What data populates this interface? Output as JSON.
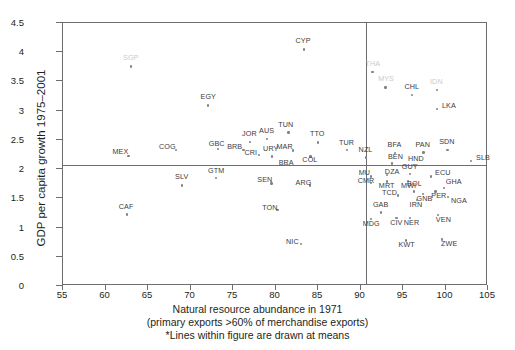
{
  "chart_data": {
    "type": "scatter",
    "title": "",
    "xlabel": "Natural resource abundance in 1971",
    "xlabel_sub": "(primary exports >60% of merchandise exports)",
    "note": "*Lines within figure are drawn at means",
    "ylabel": "GDP per capita growth 1975–2001",
    "xlim": [
      55,
      105
    ],
    "ylim": [
      0,
      4.5
    ],
    "xticks": [
      "55",
      "60",
      "65",
      "70",
      "75",
      "80",
      "85",
      "90",
      "95",
      "100",
      "105"
    ],
    "yticks": [
      "0",
      "0.5",
      "1",
      "1.5",
      "2",
      "2.5",
      "3",
      "3.5",
      "4",
      "4.5"
    ],
    "grid": false,
    "legend": "none",
    "mean_lines": {
      "x_mean": 90.6,
      "y_mean": 2.07
    },
    "point_color": "#808285",
    "line_color": "#6d6e71",
    "label_color": "#3b3b3d",
    "points": [
      {
        "label": "SGP",
        "x": 63.0,
        "y": 3.76,
        "lx": -8,
        "ly": -9,
        "faint": true
      },
      {
        "label": "CYP",
        "x": 83.3,
        "y": 4.05,
        "lx": -8,
        "ly": -9
      },
      {
        "label": "THA",
        "x": 91.4,
        "y": 3.66,
        "lx": -7,
        "ly": -9,
        "faint": true
      },
      {
        "label": "MYS",
        "x": 92.9,
        "y": 3.4,
        "lx": -7,
        "ly": -9,
        "faint": true
      },
      {
        "label": "IDN",
        "x": 99.0,
        "y": 3.36,
        "lx": -7,
        "ly": -9,
        "faint": true
      },
      {
        "label": "CHL",
        "x": 96.0,
        "y": 3.27,
        "lx": -7,
        "ly": -9
      },
      {
        "label": "EGY",
        "x": 72.0,
        "y": 3.09,
        "lx": -7,
        "ly": -9
      },
      {
        "label": "LKA",
        "x": 99.0,
        "y": 3.03,
        "lx": 5,
        "ly": -4
      },
      {
        "label": "TUN",
        "x": 81.5,
        "y": 2.63,
        "lx": -10,
        "ly": -8
      },
      {
        "label": "AUS",
        "x": 79.0,
        "y": 2.52,
        "lx": -8,
        "ly": -9
      },
      {
        "label": "JOR",
        "x": 77.0,
        "y": 2.47,
        "lx": -8,
        "ly": -9
      },
      {
        "label": "TTO",
        "x": 85.0,
        "y": 2.46,
        "lx": -8,
        "ly": -9
      },
      {
        "label": "MEX",
        "x": 62.7,
        "y": 2.23,
        "lx": -16,
        "ly": -5
      },
      {
        "label": "COG",
        "x": 68.3,
        "y": 2.33,
        "lx": -17,
        "ly": -4
      },
      {
        "label": "GBC",
        "x": 73.2,
        "y": 2.35,
        "lx": -9,
        "ly": -6
      },
      {
        "label": "BRB",
        "x": 76.2,
        "y": 2.33,
        "lx": -16,
        "ly": -4
      },
      {
        "label": "MAR",
        "x": 82.0,
        "y": 2.32,
        "lx": -16,
        "ly": -4
      },
      {
        "label": "CRI",
        "x": 78.0,
        "y": 2.25,
        "lx": -14,
        "ly": -3
      },
      {
        "label": "URY",
        "x": 79.6,
        "y": 2.22,
        "lx": -9,
        "ly": -8
      },
      {
        "label": "COL",
        "x": 84.1,
        "y": 2.22,
        "lx": -8,
        "ly": 3
      },
      {
        "label": "TUR",
        "x": 88.4,
        "y": 2.33,
        "lx": -8,
        "ly": -8
      },
      {
        "label": "BFA",
        "x": 94.0,
        "y": 2.28,
        "lx": -7,
        "ly": -9
      },
      {
        "label": "PAN",
        "x": 97.4,
        "y": 2.29,
        "lx": -8,
        "ly": -8
      },
      {
        "label": "SDN",
        "x": 100.2,
        "y": 2.33,
        "lx": -8,
        "ly": -9
      },
      {
        "label": "NZL",
        "x": 90.6,
        "y": 2.2,
        "lx": -7,
        "ly": -8
      },
      {
        "label": "BRA",
        "x": 81.2,
        "y": 2.07,
        "lx": -7,
        "ly": -3
      },
      {
        "label": "BEN",
        "x": 93.7,
        "y": 2.1,
        "lx": -4,
        "ly": -7
      },
      {
        "label": "HND",
        "x": 96.4,
        "y": 2.07,
        "lx": -7,
        "ly": -7
      },
      {
        "label": "SLB",
        "x": 103.0,
        "y": 2.14,
        "lx": 5,
        "ly": -4
      },
      {
        "label": "MU",
        "x": 91.2,
        "y": 1.88,
        "lx": -12,
        "ly": -4
      },
      {
        "label": "DZA",
        "x": 93.1,
        "y": 1.9,
        "lx": -2,
        "ly": -4
      },
      {
        "label": "GUY",
        "x": 95.8,
        "y": 1.92,
        "lx": -8,
        "ly": -8
      },
      {
        "label": "ECU",
        "x": 98.3,
        "y": 1.88,
        "lx": 4,
        "ly": -4
      },
      {
        "label": "CMR",
        "x": 91.2,
        "y": 1.77,
        "lx": -13,
        "ly": -3
      },
      {
        "label": "MRT",
        "x": 93.1,
        "y": 1.79,
        "lx": -8,
        "ly": 4
      },
      {
        "label": "MWI",
        "x": 95.6,
        "y": 1.8,
        "lx": -7,
        "ly": 4
      },
      {
        "label": "SEN",
        "x": 79.5,
        "y": 1.76,
        "lx": -14,
        "ly": -4
      },
      {
        "label": "ARG",
        "x": 84.0,
        "y": 1.72,
        "lx": -14,
        "ly": -3
      },
      {
        "label": "SLV",
        "x": 69.0,
        "y": 1.72,
        "lx": -7,
        "ly": -9
      },
      {
        "label": "GTM",
        "x": 73.0,
        "y": 1.85,
        "lx": -8,
        "ly": -8
      },
      {
        "label": "BOL",
        "x": 96.3,
        "y": 1.62,
        "lx": -7,
        "ly": -8
      },
      {
        "label": "GNB",
        "x": 97.3,
        "y": 1.58,
        "lx": -6,
        "ly": 4
      },
      {
        "label": "PER",
        "x": 98.8,
        "y": 1.62,
        "lx": -4,
        "ly": 4
      },
      {
        "label": "GHA",
        "x": 99.8,
        "y": 1.68,
        "lx": 2,
        "ly": -7
      },
      {
        "label": "NGA",
        "x": 100.3,
        "y": 1.53,
        "lx": 3,
        "ly": 3
      },
      {
        "label": "TCD",
        "x": 94.4,
        "y": 1.55,
        "lx": -16,
        "ly": -3
      },
      {
        "label": "IRN",
        "x": 96.6,
        "y": 1.47,
        "lx": -7,
        "ly": 4
      },
      {
        "label": "CAF",
        "x": 62.5,
        "y": 1.23,
        "lx": -8,
        "ly": -8
      },
      {
        "label": "TON",
        "x": 80.2,
        "y": 1.3,
        "lx": -15,
        "ly": -3
      },
      {
        "label": "GAB",
        "x": 92.4,
        "y": 1.26,
        "lx": -8,
        "ly": -8
      },
      {
        "label": "MDG",
        "x": 91.2,
        "y": 1.15,
        "lx": -8,
        "ly": 4
      },
      {
        "label": "CIV",
        "x": 94.2,
        "y": 1.17,
        "lx": -6,
        "ly": 4
      },
      {
        "label": "NER",
        "x": 95.8,
        "y": 1.17,
        "lx": -6,
        "ly": 4
      },
      {
        "label": "VEN",
        "x": 99.1,
        "y": 1.22,
        "lx": -2,
        "ly": 4
      },
      {
        "label": "NIC",
        "x": 83.0,
        "y": 0.72,
        "lx": -15,
        "ly": -3
      },
      {
        "label": "KWT",
        "x": 95.3,
        "y": 0.78,
        "lx": -7,
        "ly": 4
      },
      {
        "label": "ZWE",
        "x": 99.6,
        "y": 0.8,
        "lx": -1,
        "ly": 4
      }
    ]
  }
}
